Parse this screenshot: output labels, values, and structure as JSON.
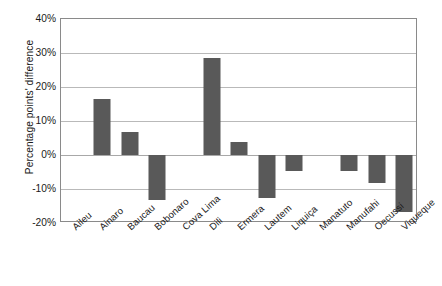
{
  "chart_data": {
    "type": "bar",
    "title": "",
    "xlabel": "",
    "ylabel": "Percentage points' difference",
    "categories": [
      "Aileu",
      "Ainaro",
      "Baucau",
      "Bobonaro",
      "Cova Lima",
      "Dili",
      "Ermera",
      "Lautem",
      "Liquiça",
      "Manatuto",
      "Manufahi",
      "Oecussi",
      "Viqueque"
    ],
    "values": [
      0,
      16.5,
      6.8,
      -13.2,
      0,
      28.5,
      3.8,
      -12.6,
      -4.6,
      0,
      -4.7,
      -8.3,
      -16.8
    ],
    "ylim": [
      -20,
      40
    ],
    "ytick_labels": [
      "40%",
      "30%",
      "20%",
      "10%",
      "0%",
      "-10%",
      "-20%"
    ],
    "ytick_values": [
      40,
      30,
      20,
      10,
      0,
      -10,
      -20
    ],
    "grid": true,
    "legend": "none",
    "bar_color": "#595959",
    "gridline_color": "#b9b9b9",
    "axis_border_color": "#8a8a8a",
    "background_color": "#ffffff",
    "text_color": "#1a1a1a"
  }
}
